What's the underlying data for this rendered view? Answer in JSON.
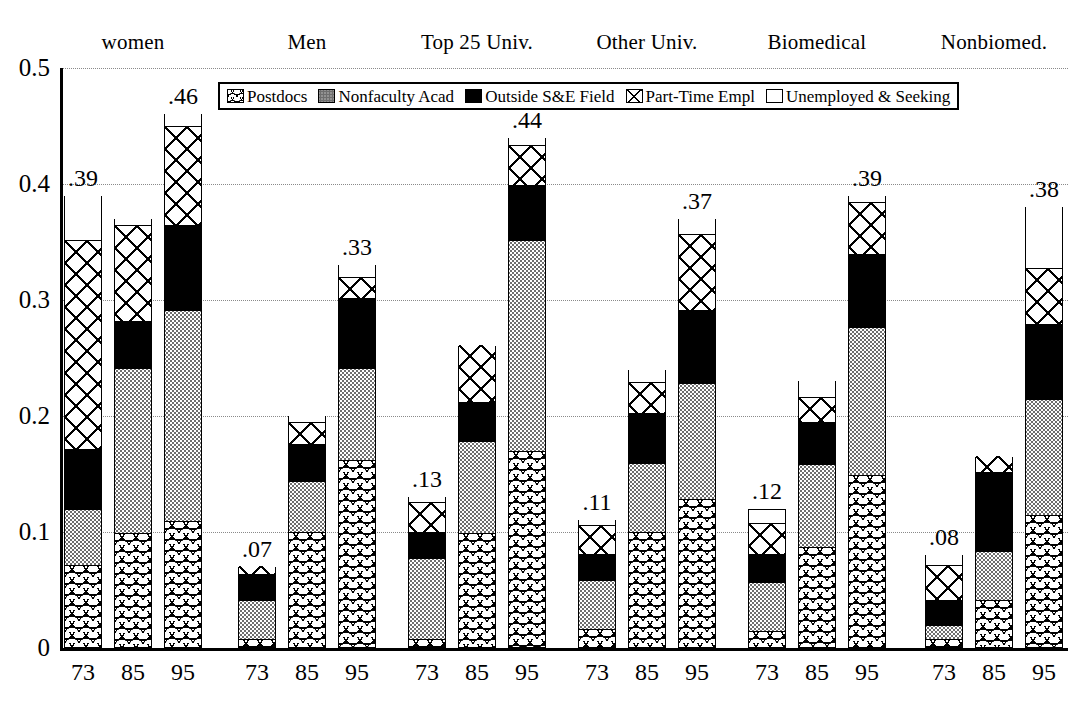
{
  "chart_data": {
    "type": "bar",
    "subtype": "stacked-bar-grouped",
    "title": "",
    "xlabel": "",
    "ylabel": "",
    "ylim": [
      0,
      0.5
    ],
    "y_ticks": [
      "0",
      "0.1",
      "0.2",
      "0.3",
      "0.4",
      "0.5"
    ],
    "y_tick_values": [
      0,
      0.1,
      0.2,
      0.3,
      0.4,
      0.5
    ],
    "grid": true,
    "legend_position": "top-center-inside",
    "series": [
      {
        "name": "Postdocs",
        "pattern": "wavy-hatch"
      },
      {
        "name": "Nonfaculty Acad",
        "pattern": "gray-stipple"
      },
      {
        "name": "Outside S&E Field",
        "pattern": "solid-black"
      },
      {
        "name": "Part-Time Empl",
        "pattern": "cross-hatch"
      },
      {
        "name": "Unemployed & Seeking",
        "pattern": "white"
      }
    ],
    "group_labels": [
      "women",
      "Men",
      "Top 25 Univ.",
      "Other Univ.",
      "Biomedical",
      "Nonbiomed."
    ],
    "categories": [
      "73",
      "85",
      "95"
    ],
    "groups": [
      {
        "label": "women",
        "bars": [
          {
            "category": "73",
            "total_label": ".39",
            "total": 0.39,
            "values": [
              0.07,
              0.048,
              0.052,
              0.18,
              0.04
            ]
          },
          {
            "category": "85",
            "total_label": "",
            "total": 0.37,
            "values": [
              0.097,
              0.143,
              0.04,
              0.083,
              0.007
            ]
          },
          {
            "category": "95",
            "total_label": ".46",
            "total": 0.46,
            "values": [
              0.108,
              0.182,
              0.073,
              0.085,
              0.012
            ]
          }
        ]
      },
      {
        "label": "Men",
        "bars": [
          {
            "category": "73",
            "total_label": ".07",
            "total": 0.07,
            "values": [
              0.006,
              0.034,
              0.022,
              0.008,
              0.0
            ]
          },
          {
            "category": "85",
            "total_label": "",
            "total": 0.2,
            "values": [
              0.098,
              0.044,
              0.032,
              0.019,
              0.007
            ]
          },
          {
            "category": "95",
            "total_label": ".33",
            "total": 0.33,
            "values": [
              0.16,
              0.08,
              0.06,
              0.018,
              0.012
            ]
          }
        ]
      },
      {
        "label": "Top 25 Univ.",
        "bars": [
          {
            "category": "73",
            "total_label": ".13",
            "total": 0.13,
            "values": [
              0.006,
              0.07,
              0.022,
              0.026,
              0.006
            ]
          },
          {
            "category": "85",
            "total_label": "",
            "total": 0.26,
            "values": [
              0.097,
              0.08,
              0.033,
              0.05,
              0.0
            ]
          },
          {
            "category": "95",
            "total_label": ".44",
            "total": 0.44,
            "values": [
              0.168,
              0.182,
              0.047,
              0.035,
              0.008
            ]
          }
        ]
      },
      {
        "label": "Other Univ.",
        "bars": [
          {
            "category": "73",
            "total_label": ".11",
            "total": 0.11,
            "values": [
              0.015,
              0.042,
              0.022,
              0.025,
              0.006
            ]
          },
          {
            "category": "85",
            "total_label": "",
            "total": 0.24,
            "values": [
              0.098,
              0.06,
              0.043,
              0.027,
              0.012
            ]
          },
          {
            "category": "95",
            "total_label": ".37",
            "total": 0.37,
            "values": [
              0.127,
              0.1,
              0.063,
              0.065,
              0.015
            ]
          }
        ]
      },
      {
        "label": "Biomedical",
        "bars": [
          {
            "category": "73",
            "total_label": ".12",
            "total": 0.12,
            "values": [
              0.013,
              0.042,
              0.024,
              0.027,
              0.009
            ]
          },
          {
            "category": "85",
            "total_label": "",
            "total": 0.23,
            "values": [
              0.085,
              0.072,
              0.036,
              0.022,
              0.015
            ]
          },
          {
            "category": "95",
            "total_label": ".39",
            "total": 0.39,
            "values": [
              0.147,
              0.128,
              0.063,
              0.045,
              0.007
            ]
          }
        ]
      },
      {
        "label": "Nonbiomed.",
        "bars": [
          {
            "category": "73",
            "total_label": ".08",
            "total": 0.08,
            "values": [
              0.006,
              0.012,
              0.022,
              0.03,
              0.01
            ]
          },
          {
            "category": "85",
            "total_label": "",
            "total": 0.165,
            "values": [
              0.04,
              0.042,
              0.068,
              0.015,
              0.0
            ]
          },
          {
            "category": "95",
            "total_label": ".38",
            "total": 0.38,
            "values": [
              0.113,
              0.1,
              0.065,
              0.048,
              0.054
            ]
          }
        ]
      }
    ]
  },
  "legend": {
    "items": [
      {
        "label": "Postdocs",
        "swatch": "postdocs-swatch-icon"
      },
      {
        "label": "Nonfaculty Acad",
        "swatch": "nonfaculty-swatch-icon"
      },
      {
        "label": "Outside S&E Field",
        "swatch": "outside-se-swatch-icon"
      },
      {
        "label": "Part-Time Empl",
        "swatch": "part-time-swatch-icon"
      },
      {
        "label": "Unemployed & Seeking",
        "swatch": "unemployed-swatch-icon"
      }
    ]
  },
  "colors": {
    "axis": "#000000",
    "grid": "#8a8a8a",
    "outside_se_field": "#000000",
    "nonfaculty_acad": "#6e6e6e",
    "background": "#ffffff"
  }
}
